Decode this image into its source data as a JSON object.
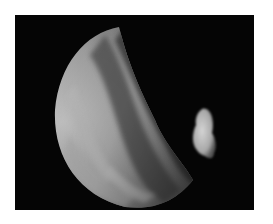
{
  "image": {
    "subject": "planet crescent with small moon against black space",
    "alt": "Crescent of a cloudy planet with a small irregular moon to the right",
    "colors": {
      "background": "#ffffff",
      "space": "#050505",
      "limb_light": "#c8c8c8",
      "cloud_mid": "#8f8f8f",
      "cloud_dark": "#4a4a4a",
      "moon": "#bdbdbd"
    }
  }
}
